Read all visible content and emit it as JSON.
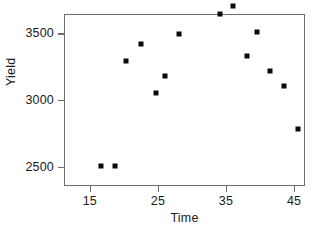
{
  "chart_data": {
    "type": "scatter",
    "title": "",
    "xlabel": "Time",
    "ylabel": "Yield",
    "xlim": [
      11.2,
      46.6
    ],
    "ylim": [
      2355,
      3645
    ],
    "xticks": [
      15,
      25,
      35,
      45
    ],
    "yticks": [
      2500,
      3000,
      3500,
      4000
    ],
    "xticklabels": [
      "15",
      "25",
      "35",
      "45"
    ],
    "yticklabels": [
      "2500",
      "3000",
      "3500",
      "4000"
    ],
    "grid": false,
    "legend": null,
    "marker": "square",
    "marker_color": "#0a0a0a",
    "marker_size_px": 5,
    "frame_color": "#6e6e6e",
    "background": "#ffffff",
    "n_points": 18,
    "x": [
      16.5,
      18.6,
      20.1,
      22.4,
      24.5,
      25.9,
      28.0,
      30.1,
      32.0,
      33.9,
      35.9,
      37.9,
      39.4,
      41.3,
      43.4,
      45.4
    ],
    "y": [
      2510,
      2515,
      3300,
      3425,
      3060,
      3190,
      3505,
      3885,
      3820,
      3650,
      3715,
      3340,
      3520,
      3225,
      3115,
      2790
    ],
    "points": [
      {
        "x": 16.5,
        "y": 2510
      },
      {
        "x": 18.6,
        "y": 2515
      },
      {
        "x": 20.1,
        "y": 3300
      },
      {
        "x": 22.4,
        "y": 3425
      },
      {
        "x": 24.5,
        "y": 3060
      },
      {
        "x": 25.9,
        "y": 3190
      },
      {
        "x": 28.0,
        "y": 3505
      },
      {
        "x": 30.1,
        "y": 3885
      },
      {
        "x": 32.0,
        "y": 3820
      },
      {
        "x": 33.9,
        "y": 3650
      },
      {
        "x": 35.9,
        "y": 3715
      },
      {
        "x": 37.9,
        "y": 3340
      },
      {
        "x": 39.4,
        "y": 3520
      },
      {
        "x": 41.3,
        "y": 3225
      },
      {
        "x": 43.4,
        "y": 3115
      },
      {
        "x": 45.4,
        "y": 2790
      }
    ]
  }
}
